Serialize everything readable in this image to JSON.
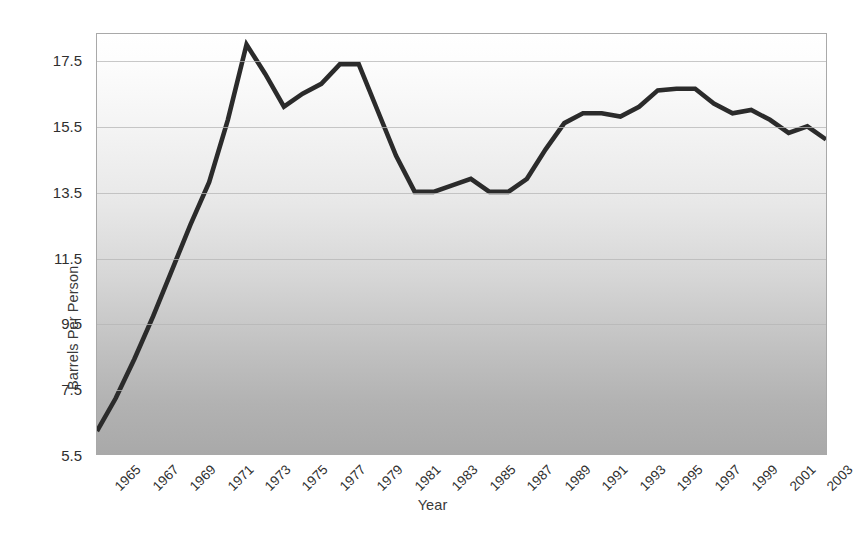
{
  "chart_data": {
    "type": "line",
    "title": "",
    "xlabel": "Year",
    "ylabel": "Barrels Per Person",
    "xlim": [
      1965,
      2004
    ],
    "ylim": [
      5.5,
      18.32
    ],
    "grid": true,
    "legend": false,
    "yticks": [
      5.5,
      7.5,
      9.5,
      11.5,
      13.5,
      15.5,
      17.5
    ],
    "ytick_labels": [
      "5.5",
      "7.5",
      "9.5",
      "11.5",
      "13.5",
      "15.5",
      "17.5"
    ],
    "xticks": [
      1965,
      1967,
      1969,
      1971,
      1973,
      1975,
      1977,
      1979,
      1981,
      1983,
      1985,
      1987,
      1989,
      1991,
      1993,
      1995,
      1997,
      1999,
      2001,
      2003
    ],
    "xtick_labels": [
      "1965",
      "1967",
      "1969",
      "1971",
      "1973",
      "1975",
      "1977",
      "1979",
      "1981",
      "1983",
      "1985",
      "1987",
      "1989",
      "1991",
      "1993",
      "1995",
      "1997",
      "1999",
      "2001",
      "2003"
    ],
    "series": [
      {
        "name": "Barrels Per Person",
        "color": "#2b2b2b",
        "x": [
          1965,
          1966,
          1967,
          1968,
          1969,
          1970,
          1971,
          1972,
          1973,
          1974,
          1975,
          1976,
          1977,
          1978,
          1979,
          1980,
          1981,
          1982,
          1983,
          1984,
          1985,
          1986,
          1987,
          1988,
          1989,
          1990,
          1991,
          1992,
          1993,
          1994,
          1995,
          1996,
          1997,
          1998,
          1999,
          2000,
          2001,
          2002,
          2003,
          2004
        ],
        "values": [
          6.2,
          7.2,
          8.4,
          9.7,
          11.1,
          12.5,
          13.8,
          15.7,
          18.0,
          17.1,
          16.1,
          16.5,
          16.8,
          17.4,
          17.4,
          16.0,
          14.6,
          13.5,
          13.5,
          13.7,
          13.9,
          13.5,
          13.5,
          13.9,
          14.8,
          15.6,
          15.9,
          15.9,
          15.8,
          16.1,
          16.6,
          16.65,
          16.65,
          16.2,
          15.9,
          16.0,
          15.7,
          15.3,
          15.5,
          15.1
        ]
      }
    ]
  },
  "axes": {
    "y_title": "Barrels Per Person",
    "x_title": "Year"
  },
  "style": {
    "line_color": "#2b2b2b",
    "frame_color": "#a9a9a9",
    "gridline_color": "#b5b5b5",
    "plot_bg_top": "#ffffff",
    "plot_bg_bottom": "#a9a9a9",
    "page_bg": "#ffffff"
  }
}
